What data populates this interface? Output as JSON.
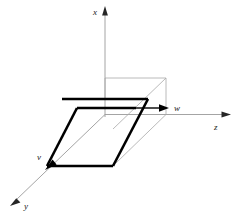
{
  "figure": {
    "title_visible": "",
    "type": "3d-coordinate-diagram",
    "background_color": "#ffffff",
    "axes": [
      {
        "id": "x",
        "label": "x",
        "direction": "up",
        "color": "#8c8c8c",
        "label_position": {
          "x": 94,
          "y": 14
        }
      },
      {
        "id": "y",
        "label": "y",
        "direction": "down-left",
        "color": "#8c8c8c",
        "label_position": {
          "x": 22,
          "y": 207
        }
      },
      {
        "id": "z",
        "label": "z",
        "direction": "right",
        "color": "#8c8c8c",
        "label_position": {
          "x": 216,
          "y": 128
        }
      }
    ],
    "vectors": [
      {
        "id": "v",
        "label": "v",
        "color": "#000000",
        "label_position": {
          "x": 41,
          "y": 161
        },
        "arrow_tip": {
          "x": 47,
          "y": 172
        }
      },
      {
        "id": "w",
        "label": "w",
        "color": "#000000",
        "label_position": {
          "x": 177,
          "y": 108
        },
        "arrow_tip": {
          "x": 168,
          "y": 114
        }
      }
    ],
    "shapes": {
      "bold_loop_color": "#000000",
      "construction_line_color": "#a6a6a6",
      "bold_stroke_width": 2.6,
      "thin_stroke_width": 0.7
    }
  }
}
